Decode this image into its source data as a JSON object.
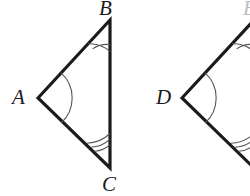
{
  "figure": {
    "background_color": "#ffffff",
    "stroke_color": "#1b1b1b",
    "arc_color": "#55555a",
    "width": 250,
    "height": 196
  },
  "labels": {
    "a": "A",
    "b": "B",
    "c": "C",
    "d": "D",
    "e": "E"
  },
  "triangles": [
    {
      "name": "triangle-abc",
      "vertices": [
        {
          "label": "A",
          "x": 38,
          "y": 98,
          "arc_count": 1
        },
        {
          "label": "B",
          "x": 110,
          "y": 20,
          "arc_count": 2
        },
        {
          "label": "C",
          "x": 110,
          "y": 168,
          "arc_count": 3
        }
      ],
      "clipped": false
    },
    {
      "name": "triangle-def",
      "vertices": [
        {
          "label": "D",
          "x": 182,
          "y": 98,
          "arc_count": 1
        },
        {
          "label": "E",
          "x": 254,
          "y": 20,
          "arc_count": 2
        },
        {
          "label": "F",
          "x": 254,
          "y": 168,
          "arc_count": 3
        }
      ],
      "clipped": true
    }
  ]
}
